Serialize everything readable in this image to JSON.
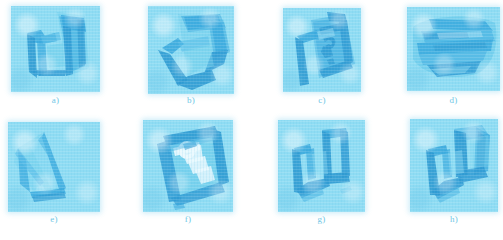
{
  "figure": {
    "kind": "photographic-plate",
    "page_background": "#ffffff",
    "duotone": {
      "paper": "#8fdcf3",
      "mid": "#5fc4e8",
      "stroke": "#3aa9dd",
      "stroke_dark": "#2f9ad2",
      "highlight": "#c6eefb",
      "white": "#eaf9fe"
    },
    "caption_color": "#6fc7e6",
    "rows": 2,
    "columns": 4,
    "panels": [
      {
        "id": "a",
        "label": "a)",
        "description": "angular bracket-shaped specimen, two tall prongs",
        "x": 11,
        "y": 6,
        "w": 89,
        "h": 86,
        "caption_x": 11,
        "caption_y": 95,
        "caption_w": 89
      },
      {
        "id": "b",
        "label": "b)",
        "description": "tilted U-shaped specimen rotated clockwise",
        "x": 148,
        "y": 6,
        "w": 86,
        "h": 88,
        "caption_x": 148,
        "caption_y": 95,
        "caption_w": 86
      },
      {
        "id": "c",
        "label": "c)",
        "description": "square plate with hooked inner scroll and long tail",
        "x": 283,
        "y": 8,
        "w": 78,
        "h": 84,
        "caption_x": 283,
        "caption_y": 95,
        "caption_w": 78
      },
      {
        "id": "d",
        "label": "d)",
        "description": "broad horizontal layered slab, wide format",
        "x": 407,
        "y": 7,
        "w": 93,
        "h": 84,
        "caption_x": 407,
        "caption_y": 95,
        "caption_w": 93
      },
      {
        "id": "e",
        "label": "e)",
        "description": "two slender tapering blades meeting at a point",
        "x": 8,
        "y": 122,
        "w": 92,
        "h": 90,
        "caption_x": 8,
        "caption_y": 214,
        "caption_w": 92
      },
      {
        "id": "f",
        "label": "f)",
        "description": "tilted frame containing a white zigzag staircase and ring",
        "x": 143,
        "y": 120,
        "w": 90,
        "h": 92,
        "caption_x": 143,
        "caption_y": 214,
        "caption_w": 90
      },
      {
        "id": "g",
        "label": "g)",
        "description": "open U / bracket outline drawn in dark strokes",
        "x": 278,
        "y": 120,
        "w": 87,
        "h": 92,
        "caption_x": 278,
        "caption_y": 214,
        "caption_w": 87
      },
      {
        "id": "h",
        "label": "h)",
        "description": "rounded U outline with thick right limb",
        "x": 410,
        "y": 119,
        "w": 88,
        "h": 93,
        "caption_x": 410,
        "caption_y": 214,
        "caption_w": 88
      }
    ]
  }
}
